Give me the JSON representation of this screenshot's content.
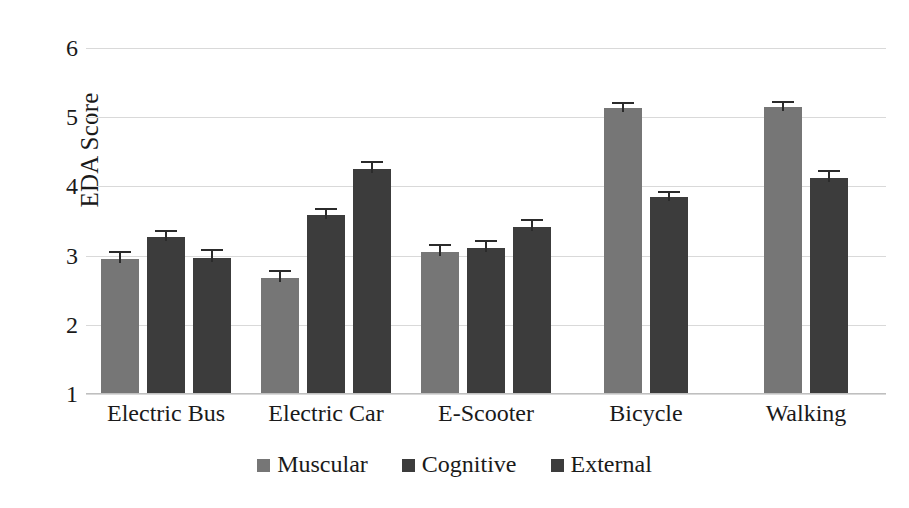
{
  "chart_data": {
    "type": "bar",
    "title": "",
    "xlabel": "",
    "ylabel": "EDA Score",
    "ylim": [
      1,
      6
    ],
    "ytick_labels": [
      "6",
      "5",
      "4",
      "3",
      "2",
      "1"
    ],
    "ytick_values": [
      6,
      5,
      4,
      3,
      2,
      1
    ],
    "grid": true,
    "legend_position": "bottom",
    "categories": [
      "Electric Bus",
      "Electric Car",
      "E-Scooter",
      "Bicycle",
      "Walking"
    ],
    "series": [
      {
        "name": "Muscular",
        "color": "#767676",
        "values": [
          2.95,
          2.68,
          3.05,
          5.13,
          5.15
        ],
        "errors": [
          0.12,
          0.11,
          0.12,
          0.09,
          0.09
        ]
      },
      {
        "name": "Cognitive",
        "color": "#3c3c3c",
        "values": [
          3.27,
          3.58,
          3.11,
          3.85,
          4.12
        ],
        "errors": [
          0.1,
          0.11,
          0.11,
          0.08,
          0.12
        ]
      },
      {
        "name": "External",
        "color": "#3c3c3c",
        "values": [
          2.97,
          4.25,
          3.41,
          null,
          null
        ],
        "errors": [
          0.12,
          0.12,
          0.12,
          null,
          null
        ]
      }
    ]
  },
  "legend": {
    "items": [
      {
        "label": "Muscular",
        "color": "#767676"
      },
      {
        "label": "Cognitive",
        "color": "#3c3c3c"
      },
      {
        "label": "External",
        "color": "#3c3c3c"
      }
    ]
  }
}
